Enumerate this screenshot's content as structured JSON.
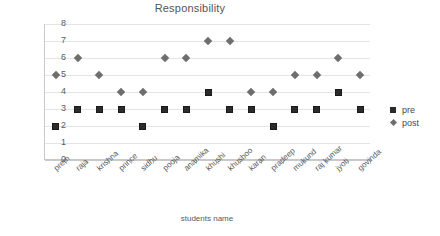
{
  "chart_data": {
    "type": "scatter",
    "title": "Responsibility",
    "xlabel": "students name",
    "ylabel": "TestScore",
    "ylim": [
      0,
      8
    ],
    "yticks": [
      0,
      1,
      2,
      3,
      4,
      5,
      6,
      7,
      8
    ],
    "grid": true,
    "legend_position": "right",
    "categories": [
      "prem",
      "raja",
      "krishna",
      "prince",
      "sidhu",
      "pooja",
      "anamika",
      "khushi",
      "khusboo",
      "karan",
      "pradeep",
      "mukund",
      "raj kumar",
      "jyoti",
      "govinda"
    ],
    "series": [
      {
        "name": "pre",
        "marker": "square",
        "color": "#2b2b2b",
        "values": [
          2,
          3,
          3,
          3,
          2,
          3,
          3,
          4,
          3,
          3,
          2,
          3,
          3,
          4,
          3
        ]
      },
      {
        "name": "post",
        "marker": "diamond",
        "color": "#6e6e6e",
        "values": [
          5,
          6,
          5,
          4,
          4,
          6,
          6,
          7,
          7,
          4,
          4,
          5,
          5,
          6,
          5
        ]
      }
    ]
  },
  "legend": {
    "entries": [
      {
        "label": "pre"
      },
      {
        "label": "post"
      }
    ]
  }
}
